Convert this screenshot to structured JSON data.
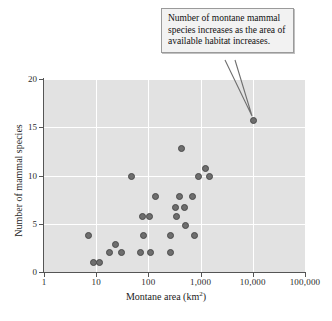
{
  "chart_data": {
    "type": "scatter",
    "title": "",
    "xlabel": "Montane area (km²)",
    "ylabel": "Number of mammal species",
    "xscale": "log",
    "yscale": "linear",
    "xlim": [
      1,
      100000
    ],
    "ylim": [
      0,
      20
    ],
    "grid": true,
    "legend": "none",
    "x_ticks": [
      1,
      10,
      100,
      1000,
      10000,
      100000
    ],
    "x_tick_labels": [
      "1",
      "10",
      "100",
      "1,000",
      "10,000",
      "100,000"
    ],
    "y_ticks": [
      0,
      5,
      10,
      15,
      20
    ],
    "y_tick_labels": [
      "0",
      "5",
      "10",
      "15",
      "20"
    ],
    "points": [
      {
        "x": 7,
        "y": 3.8
      },
      {
        "x": 9,
        "y": 1.0
      },
      {
        "x": 11.5,
        "y": 1.0
      },
      {
        "x": 18,
        "y": 2.0
      },
      {
        "x": 23,
        "y": 2.8
      },
      {
        "x": 30,
        "y": 2.0
      },
      {
        "x": 48,
        "y": 9.9
      },
      {
        "x": 72,
        "y": 2.0
      },
      {
        "x": 78,
        "y": 5.7
      },
      {
        "x": 80,
        "y": 3.8
      },
      {
        "x": 105,
        "y": 5.7
      },
      {
        "x": 110,
        "y": 2.0
      },
      {
        "x": 135,
        "y": 7.8
      },
      {
        "x": 260,
        "y": 3.8
      },
      {
        "x": 270,
        "y": 2.0
      },
      {
        "x": 330,
        "y": 6.7
      },
      {
        "x": 340,
        "y": 5.7
      },
      {
        "x": 400,
        "y": 7.8
      },
      {
        "x": 430,
        "y": 12.8
      },
      {
        "x": 500,
        "y": 6.7
      },
      {
        "x": 520,
        "y": 4.8
      },
      {
        "x": 700,
        "y": 7.8
      },
      {
        "x": 760,
        "y": 3.8
      },
      {
        "x": 900,
        "y": 9.9
      },
      {
        "x": 1250,
        "y": 10.7
      },
      {
        "x": 1450,
        "y": 9.9
      },
      {
        "x": 10500,
        "y": 15.7
      }
    ],
    "annotations": [
      {
        "text": "Number of montane mammal species increases as the area of available habitat increases.",
        "points_to": {
          "x": 10500,
          "y": 15.7
        }
      }
    ],
    "colors": {
      "plot_background": "#e2e2e2",
      "gridline": "#ffffff",
      "marker_fill": "#6e6e6e",
      "marker_edge": "#4a4a4a",
      "axis": "#555555",
      "callout_background": "#f2f2f2",
      "callout_border": "#9a9a9a",
      "text": "#101010"
    }
  },
  "axes": {
    "x_title": "Montane area (km",
    "x_title_sup": "2",
    "x_title_end": ")",
    "y_title": "Number of mammal species"
  },
  "callout": {
    "text": "Number of montane mammal species increases as the area of available habitat increases."
  },
  "caption": {
    "text": ""
  }
}
